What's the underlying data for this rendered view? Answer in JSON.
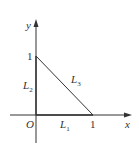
{
  "diagram": {
    "type": "coordinate-triangle",
    "axes": {
      "x_label": "x",
      "y_label": "y",
      "origin_label": "O"
    },
    "ticks": {
      "x_one": "1",
      "y_one": "1"
    },
    "segments": [
      {
        "name": "L",
        "sub": "1",
        "from": [
          0,
          0
        ],
        "to": [
          1,
          0
        ]
      },
      {
        "name": "L",
        "sub": "2",
        "from": [
          0,
          0
        ],
        "to": [
          0,
          1
        ]
      },
      {
        "name": "L",
        "sub": "3",
        "from": [
          0,
          1
        ],
        "to": [
          1,
          0
        ]
      }
    ],
    "colors": {
      "line": "#333333"
    }
  }
}
